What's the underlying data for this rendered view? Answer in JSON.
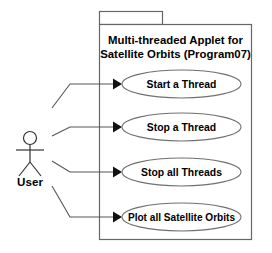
{
  "diagram": {
    "type": "uml-use-case-diagram",
    "system": {
      "title_lines": [
        "Multi-threaded Applet for",
        "Satellite Orbits (Program07)"
      ],
      "boundary": {
        "x": 99,
        "y": 24,
        "width": 153,
        "height": 216
      },
      "tab": {
        "x": 99,
        "y": 11,
        "width": 64,
        "height": 13
      },
      "border_color": "#666666",
      "fill_color": "#ffffff"
    },
    "actor": {
      "label": "User",
      "head_center": {
        "x": 30,
        "y": 138
      },
      "head_radius": 6.5,
      "body_top": {
        "x": 30,
        "y": 144.5
      },
      "body_bottom": {
        "x": 30,
        "y": 162
      },
      "arms_y": 150,
      "arms_left_x": 16,
      "arms_right_x": 44,
      "leg_left_end": {
        "x": 19,
        "y": 176
      },
      "leg_right_end": {
        "x": 41,
        "y": 176
      },
      "stroke_color": "#333333"
    },
    "use_cases": [
      {
        "label": "Start a Thread",
        "cx": 181.5,
        "cy": 84,
        "rx": 59.5,
        "ry": 14,
        "text_size": "normal"
      },
      {
        "label": "Stop a Thread",
        "cx": 181.5,
        "cy": 127,
        "rx": 59.5,
        "ry": 14,
        "text_size": "normal"
      },
      {
        "label": "Stop all Threads",
        "cx": 181.5,
        "cy": 172,
        "rx": 59.5,
        "ry": 14,
        "text_size": "normal"
      },
      {
        "label": "Plot all Satellite Orbits",
        "cx": 181.5,
        "cy": 217,
        "rx": 59.5,
        "ry": 14,
        "text_size": "tight"
      }
    ],
    "associations": [
      {
        "from": "User",
        "to": "Start a Thread",
        "points": "52,108 70,84 113,84",
        "arrow": {
          "tip_x": 122,
          "tip_y": 84
        }
      },
      {
        "from": "User",
        "to": "Stop a Thread",
        "points": "52,136 70,127 113,127",
        "arrow": {
          "tip_x": 122,
          "tip_y": 127
        }
      },
      {
        "from": "User",
        "to": "Stop all Threads",
        "points": "52,161 70,172 113,172",
        "arrow": {
          "tip_x": 122,
          "tip_y": 172
        }
      },
      {
        "from": "User",
        "to": "Plot all Satellite Orbits",
        "points": "52,186 70,217 113,217",
        "arrow": {
          "tip_x": 122,
          "tip_y": 217
        }
      }
    ],
    "arrow_color": "#111111",
    "connector_color": "#555555"
  }
}
